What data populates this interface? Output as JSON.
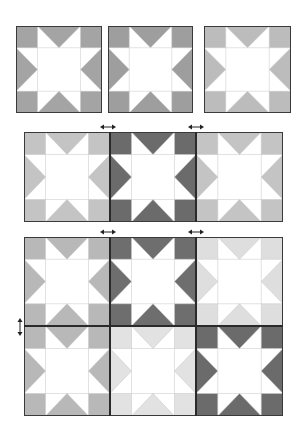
{
  "diagram": {
    "colors": {
      "medium": "#a4a4a4",
      "medium_b": "#9e9e9e",
      "light": "#bcbcbc",
      "medium_light": "#c4c4c4",
      "dark": "#6b6b6b",
      "very_light": "#e0e0e0",
      "background": "#ffffff",
      "seam": "#c8c8c8",
      "border": "#3a3a3a"
    },
    "step1": {
      "label": "Three individual star blocks",
      "blocks": [
        {
          "x": 16,
          "y": 26,
          "w": 86,
          "h": 87,
          "color": "#a4a4a4"
        },
        {
          "x": 108,
          "y": 26,
          "w": 85,
          "h": 87,
          "color": "#9e9e9e"
        },
        {
          "x": 204,
          "y": 26,
          "w": 87,
          "h": 87,
          "color": "#bcbcbc"
        }
      ]
    },
    "step2": {
      "label": "Blocks joined into a row",
      "blocks": [
        {
          "x": 24,
          "y": 132,
          "w": 86,
          "h": 90,
          "color": "#c4c4c4"
        },
        {
          "x": 110,
          "y": 132,
          "w": 86,
          "h": 90,
          "color": "#6b6b6b"
        },
        {
          "x": 196,
          "y": 132,
          "w": 87,
          "h": 90,
          "color": "#c4c4c4"
        }
      ],
      "arrows": [
        {
          "x": 100,
          "y": 124,
          "direction": "horizontal"
        },
        {
          "x": 188,
          "y": 124,
          "direction": "horizontal"
        }
      ]
    },
    "step3": {
      "label": "Rows joined into a 3x2 quilt top",
      "blocks": [
        {
          "x": 24,
          "y": 237,
          "w": 86,
          "h": 89,
          "color": "#b8b8b8"
        },
        {
          "x": 110,
          "y": 237,
          "w": 86,
          "h": 89,
          "color": "#6e6e6e"
        },
        {
          "x": 196,
          "y": 237,
          "w": 87,
          "h": 89,
          "color": "#dedede"
        },
        {
          "x": 24,
          "y": 326,
          "w": 86,
          "h": 90,
          "color": "#b8b8b8"
        },
        {
          "x": 110,
          "y": 326,
          "w": 86,
          "h": 90,
          "color": "#e2e2e2"
        },
        {
          "x": 196,
          "y": 326,
          "w": 87,
          "h": 90,
          "color": "#6b6b6b"
        }
      ],
      "arrows": [
        {
          "x": 100,
          "y": 229,
          "direction": "horizontal"
        },
        {
          "x": 188,
          "y": 229,
          "direction": "horizontal"
        },
        {
          "x": 17,
          "y": 318,
          "direction": "vertical"
        }
      ]
    }
  }
}
